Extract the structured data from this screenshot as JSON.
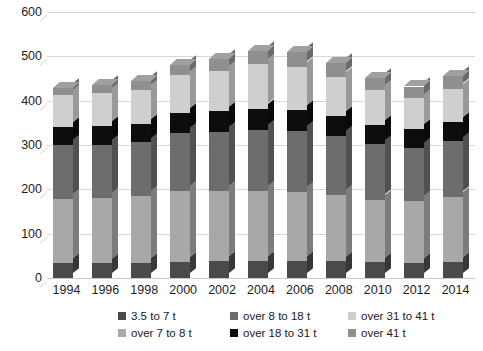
{
  "chart_data": {
    "type": "bar",
    "subtype": "stacked-column-3d",
    "title": "",
    "xlabel": "",
    "ylabel": "",
    "ylim": [
      0,
      600
    ],
    "ytick_step": 100,
    "grid": true,
    "legend_position": "bottom",
    "categories": [
      "1994",
      "1996",
      "1998",
      "2000",
      "2002",
      "2004",
      "2006",
      "2008",
      "2010",
      "2012",
      "2014"
    ],
    "yticks": [
      "0",
      "100",
      "200",
      "300",
      "400",
      "500",
      "600"
    ],
    "series": [
      {
        "name": "3.5 to 7 t",
        "color": "#4a4a4a",
        "values": [
          33,
          33,
          34,
          37,
          38,
          39,
          39,
          38,
          35,
          34,
          36
        ]
      },
      {
        "name": "over 7 to 8 t",
        "color": "#a8a8a8",
        "values": [
          145,
          148,
          150,
          160,
          158,
          157,
          155,
          150,
          142,
          140,
          147
        ]
      },
      {
        "name": "over 8 to 18 t",
        "color": "#6d6d6d",
        "values": [
          122,
          120,
          122,
          130,
          133,
          138,
          137,
          132,
          125,
          120,
          125
        ]
      },
      {
        "name": "over 18 to 31 t",
        "color": "#0d0d0d",
        "values": [
          40,
          42,
          42,
          45,
          47,
          48,
          48,
          46,
          44,
          42,
          45
        ]
      },
      {
        "name": "over 31 to 41 t",
        "color": "#cfcfcf",
        "values": [
          72,
          74,
          76,
          85,
          92,
          100,
          98,
          88,
          78,
          70,
          74
        ]
      },
      {
        "name": "over 41 t",
        "color": "#8f8f8f",
        "values": [
          16,
          18,
          20,
          24,
          26,
          30,
          32,
          30,
          28,
          26,
          28
        ]
      }
    ],
    "totals": [
      428,
      435,
      444,
      481,
      494,
      512,
      509,
      484,
      452,
      432,
      455
    ]
  },
  "legend": {
    "items": [
      {
        "label": "3.5 to 7 t",
        "color": "#4a4a4a"
      },
      {
        "label": "over 7 to 8 t",
        "color": "#a8a8a8"
      },
      {
        "label": "over 8 to 18 t",
        "color": "#6d6d6d"
      },
      {
        "label": "over 18 to 31 t",
        "color": "#0d0d0d"
      },
      {
        "label": "over 31 to 41 t",
        "color": "#cfcfcf"
      },
      {
        "label": "over 41 t",
        "color": "#8f8f8f"
      }
    ]
  },
  "style": {
    "background": "#ffffff",
    "gridline_color": "#d7d7d7",
    "text_color": "#1a1a1a"
  }
}
